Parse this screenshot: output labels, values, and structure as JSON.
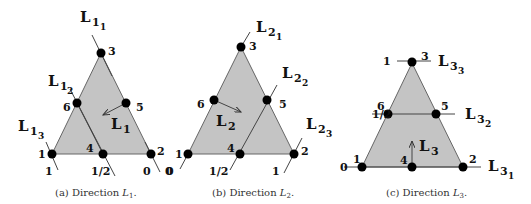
{
  "figures": [
    {
      "id": "a",
      "caption_prefix": "(a) Direction ",
      "caption_var": "L",
      "caption_sub": "1",
      "caption_suffix": ".",
      "nodes": {
        "n1": "1",
        "n2": "2",
        "n3": "3",
        "n4": "4",
        "n5": "5",
        "n6": "6"
      },
      "lines": [
        {
          "main": "L",
          "sub": "1",
          "subsub": "1",
          "value": "0"
        },
        {
          "main": "L",
          "sub": "1",
          "subsub": "2",
          "value": "1/2"
        },
        {
          "main": "L",
          "sub": "1",
          "subsub": "3",
          "value": "1"
        }
      ],
      "extra_value": "0",
      "direction": {
        "main": "L",
        "sub": "1"
      }
    },
    {
      "id": "b",
      "caption_prefix": "(b) Direction ",
      "caption_var": "L",
      "caption_sub": "2",
      "caption_suffix": ".",
      "nodes": {
        "n1": "1",
        "n2": "2",
        "n3": "3",
        "n4": "4",
        "n5": "5",
        "n6": "6"
      },
      "lines": [
        {
          "main": "L",
          "sub": "2",
          "subsub": "1",
          "value": "0"
        },
        {
          "main": "L",
          "sub": "2",
          "subsub": "2",
          "value": "1/2"
        },
        {
          "main": "L",
          "sub": "2",
          "subsub": "3",
          "value": "1"
        }
      ],
      "direction": {
        "main": "L",
        "sub": "2"
      }
    },
    {
      "id": "c",
      "caption_prefix": "(c) Direction ",
      "caption_var": "L",
      "caption_sub": "3",
      "caption_suffix": ".",
      "nodes": {
        "n1": "1",
        "n2": "2",
        "n3": "3",
        "n4": "4",
        "n5": "5",
        "n6": "6"
      },
      "lines": [
        {
          "main": "L",
          "sub": "3",
          "subsub": "1",
          "value": "0"
        },
        {
          "main": "L",
          "sub": "3",
          "subsub": "2",
          "value": "1/2"
        },
        {
          "main": "L",
          "sub": "3",
          "subsub": "3",
          "value": "1"
        }
      ],
      "direction": {
        "main": "L",
        "sub": "3"
      }
    }
  ]
}
